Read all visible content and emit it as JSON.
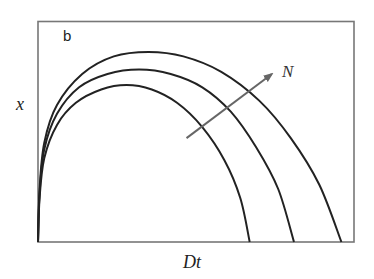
{
  "chart_data": {
    "type": "line",
    "panel_label": "b",
    "title": "",
    "xlabel": "Dt",
    "ylabel": "x",
    "xlim": [
      0,
      1
    ],
    "ylim": [
      0,
      1
    ],
    "grid": false,
    "ticks": false,
    "legend": null,
    "line_color": "#222222",
    "frame_color": "#777777",
    "series": [
      {
        "name": "curve-inner (small N)",
        "points": [
          [
            0,
            0
          ],
          [
            0.005,
            0.2
          ],
          [
            0.02,
            0.38
          ],
          [
            0.06,
            0.53
          ],
          [
            0.12,
            0.63
          ],
          [
            0.2,
            0.69
          ],
          [
            0.28,
            0.71
          ],
          [
            0.36,
            0.69
          ],
          [
            0.44,
            0.63
          ],
          [
            0.52,
            0.52
          ],
          [
            0.59,
            0.37
          ],
          [
            0.64,
            0.2
          ],
          [
            0.67,
            0
          ]
        ]
      },
      {
        "name": "curve-middle",
        "points": [
          [
            0,
            0
          ],
          [
            0.005,
            0.22
          ],
          [
            0.02,
            0.42
          ],
          [
            0.06,
            0.58
          ],
          [
            0.13,
            0.7
          ],
          [
            0.22,
            0.76
          ],
          [
            0.32,
            0.78
          ],
          [
            0.42,
            0.76
          ],
          [
            0.52,
            0.7
          ],
          [
            0.61,
            0.59
          ],
          [
            0.69,
            0.43
          ],
          [
            0.76,
            0.24
          ],
          [
            0.81,
            0
          ]
        ]
      },
      {
        "name": "curve-outer (large N)",
        "points": [
          [
            0,
            0
          ],
          [
            0.005,
            0.24
          ],
          [
            0.02,
            0.45
          ],
          [
            0.06,
            0.62
          ],
          [
            0.14,
            0.76
          ],
          [
            0.24,
            0.84
          ],
          [
            0.35,
            0.86
          ],
          [
            0.46,
            0.84
          ],
          [
            0.58,
            0.77
          ],
          [
            0.7,
            0.64
          ],
          [
            0.8,
            0.47
          ],
          [
            0.89,
            0.26
          ],
          [
            0.96,
            0
          ]
        ]
      }
    ],
    "annotations": [
      {
        "type": "arrow",
        "label": "N",
        "from": [
          0.47,
          0.47
        ],
        "to": [
          0.74,
          0.76
        ],
        "color": "#666666",
        "meaning": "direction of increasing N across curves"
      }
    ]
  }
}
